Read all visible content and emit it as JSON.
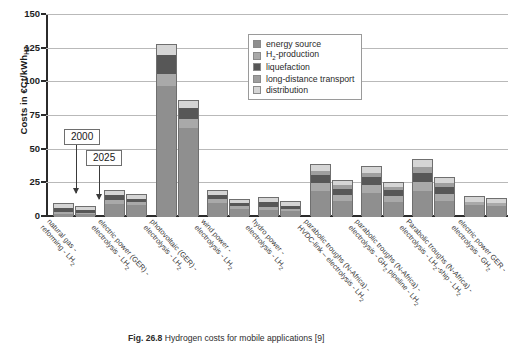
{
  "figure": {
    "caption_prefix": "Fig. 26.8",
    "caption_text": "Hydrogen costs for mobile applications [9]"
  },
  "axis": {
    "y_title_text": "Costs in €Ct/kWh",
    "y_title_sub": "H2",
    "y_ticks": [
      "0",
      "25",
      "50",
      "75",
      "100",
      "125",
      "150"
    ],
    "y_min": 0,
    "y_max": 150
  },
  "legend": {
    "items": [
      {
        "label": "energy source",
        "color": "#8f8f8f"
      },
      {
        "label": "H",
        "sub": "2",
        "label_tail": "-production",
        "color": "#a9a9a9"
      },
      {
        "label": "liquefaction",
        "color": "#575757"
      },
      {
        "label": "long-distance transport",
        "color": "#9e9e9e"
      },
      {
        "label": "distribution",
        "color": "#d5d5d5"
      }
    ]
  },
  "callouts": {
    "year_2000": "2000",
    "year_2025": "2025"
  },
  "chart_data": {
    "type": "bar",
    "subtype": "stacked-grouped",
    "title": "Hydrogen costs for mobile applications",
    "xlabel": "",
    "ylabel": "Costs in €Ct/kWhH2",
    "ylim": [
      0,
      150
    ],
    "yticks": [
      0,
      25,
      50,
      75,
      100,
      125,
      150
    ],
    "grid": "horizontal",
    "legend_position": "top-right-inside",
    "group_labels": [
      "2000",
      "2025"
    ],
    "segment_names": [
      "energy source",
      "H2-production",
      "liquefaction",
      "long-distance transport",
      "distribution"
    ],
    "segment_colors": [
      "#8f8f8f",
      "#a9a9a9",
      "#575757",
      "#9e9e9e",
      "#d5d5d5"
    ],
    "categories": [
      {
        "line1": "natural gas -",
        "line2": "reforming - LH",
        "sub2": "2"
      },
      {
        "line1": "electric power (GER) -",
        "line2": "electrolysis - LH",
        "sub2": "2"
      },
      {
        "line1": "photovoltaic (GER) -",
        "line2": "electrolysis - LH",
        "sub2": "2"
      },
      {
        "line1": "wind power -",
        "line2": "electrolysis - LH",
        "sub2": "2"
      },
      {
        "line1": "hydro power -",
        "line2": "electrolysis - LH",
        "sub2": "2"
      },
      {
        "line1": "parabolic troughs (N-Africa) -",
        "line2": "HVDC-link – electrolysis - LH",
        "sub2": "2"
      },
      {
        "line1": "parabolic troughs (N-Africa) -",
        "line2": "electrolysis - GH",
        "sub2": "2",
        "line2_tail": " pipeline - LH",
        "sub3": "2"
      },
      {
        "line1": "Parabolic troughs (N-Africa) -",
        "line2": "electrolysis - LH",
        "sub2": "2",
        "line2_tail": "-ship - LH",
        "sub3": "2"
      },
      {
        "line1": "electric power GER -",
        "line2": "electrolysis - GH",
        "sub2": "2"
      }
    ],
    "series": [
      {
        "name": "2000",
        "stacks": [
          {
            "energy source": 2.5,
            "H2-production": 1.5,
            "liquefaction": 3.0,
            "long-distance transport": 0.0,
            "distribution": 2.5,
            "total": 9.5
          },
          {
            "energy source": 10.0,
            "H2-production": 2.5,
            "liquefaction": 3.5,
            "long-distance transport": 0.0,
            "distribution": 3.0,
            "total": 19.0
          },
          {
            "energy source": 97.0,
            "H2-production": 9.0,
            "liquefaction": 14.0,
            "long-distance transport": 0.0,
            "distribution": 8.0,
            "total": 128.0
          },
          {
            "energy source": 10.5,
            "H2-production": 2.5,
            "liquefaction": 3.5,
            "long-distance transport": 0.0,
            "distribution": 3.0,
            "total": 19.5
          },
          {
            "energy source": 5.5,
            "H2-production": 2.0,
            "liquefaction": 3.5,
            "long-distance transport": 0.0,
            "distribution": 3.0,
            "total": 14.0
          },
          {
            "energy source": 19.0,
            "H2-production": 6.0,
            "liquefaction": 6.0,
            "long-distance transport": 3.5,
            "distribution": 4.0,
            "total": 38.5
          },
          {
            "energy source": 18.0,
            "H2-production": 6.0,
            "liquefaction": 6.0,
            "long-distance transport": 3.0,
            "distribution": 4.0,
            "total": 37.0
          },
          {
            "energy source": 19.0,
            "H2-production": 7.0,
            "liquefaction": 7.0,
            "long-distance transport": 4.0,
            "distribution": 5.0,
            "total": 42.0
          },
          {
            "energy source": 9.0,
            "H2-production": 2.5,
            "liquefaction": 0.0,
            "long-distance transport": 0.0,
            "distribution": 3.0,
            "total": 14.5
          }
        ]
      },
      {
        "name": "2025",
        "stacks": [
          {
            "energy source": 2.0,
            "H2-production": 1.0,
            "liquefaction": 2.5,
            "long-distance transport": 0.0,
            "distribution": 2.0,
            "total": 7.5
          },
          {
            "energy source": 9.0,
            "H2-production": 2.0,
            "liquefaction": 2.5,
            "long-distance transport": 0.0,
            "distribution": 2.5,
            "total": 16.0
          },
          {
            "energy source": 66.0,
            "H2-production": 7.0,
            "liquefaction": 8.0,
            "long-distance transport": 0.0,
            "distribution": 5.0,
            "total": 86.0
          },
          {
            "energy source": 6.0,
            "H2-production": 2.0,
            "liquefaction": 2.5,
            "long-distance transport": 0.0,
            "distribution": 2.5,
            "total": 13.0
          },
          {
            "energy source": 4.5,
            "H2-production": 1.5,
            "liquefaction": 2.5,
            "long-distance transport": 0.0,
            "distribution": 2.5,
            "total": 11.0
          },
          {
            "energy source": 12.0,
            "H2-production": 4.5,
            "liquefaction": 4.5,
            "long-distance transport": 2.5,
            "distribution": 3.0,
            "total": 26.5
          },
          {
            "energy source": 11.0,
            "H2-production": 4.5,
            "liquefaction": 4.5,
            "long-distance transport": 2.0,
            "distribution": 3.0,
            "total": 25.0
          },
          {
            "energy source": 12.0,
            "H2-production": 5.0,
            "liquefaction": 5.5,
            "long-distance transport": 3.0,
            "distribution": 3.5,
            "total": 29.0
          },
          {
            "energy source": 8.5,
            "H2-production": 2.0,
            "liquefaction": 0.0,
            "long-distance transport": 0.0,
            "distribution": 3.0,
            "total": 13.5
          }
        ]
      }
    ]
  }
}
